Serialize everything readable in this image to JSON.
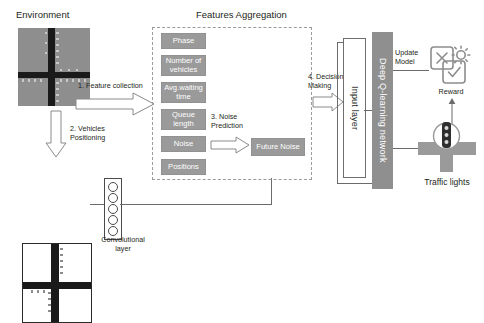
{
  "diagram": {
    "type": "flow-architecture"
  },
  "sections": {
    "environment_label": "Environment",
    "features_aggregation_label": "Features Aggregation",
    "convolutional_layer_label": "Convolutional\nlayer",
    "traffic_lights_label": "Traffic lights",
    "reward_label": "Reward"
  },
  "features": [
    {
      "id": "phase",
      "label": "Phase"
    },
    {
      "id": "number-of-vehicles",
      "label": "Number of\nvehicles"
    },
    {
      "id": "avg-waiting-time",
      "label": "Avg.waiting\ntime"
    },
    {
      "id": "queue-length",
      "label": "Queue\nlength"
    },
    {
      "id": "noise",
      "label": "Noise"
    },
    {
      "id": "positions",
      "label": "Positions"
    }
  ],
  "derived": {
    "future_noise_label": "Future Noise"
  },
  "network": {
    "input_layer_label": "Input layer",
    "deep_q_label": "Deep Q-learning network",
    "update_model_label": "Update\nModel"
  },
  "steps": {
    "step1": "1. Feature collection",
    "step2": "2. Vehicles\nPositioning",
    "step3": "3. Noise\nPrediction",
    "step4": "4. Decision\nMaking"
  },
  "icons": {
    "reward_x_card": "x-card-icon",
    "reward_gear": "gear-icon",
    "reward_check_card": "check-card-icon",
    "traffic_light": "traffic-light-icon"
  },
  "colors": {
    "chip_fill": "#9a9a9a",
    "dqn_fill": "#8f8f8f",
    "env_fill": "#8e8e8e",
    "road_dark": "#2f2f2f",
    "dashed_border": "#9b9b9b",
    "line": "#6b6b6b",
    "text": "#231f20"
  }
}
